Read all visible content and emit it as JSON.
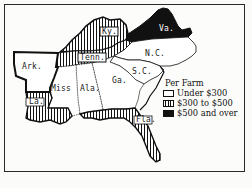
{
  "map": {
    "region": "Southern United States",
    "states": [
      {
        "id": "ark",
        "label": "Ark.",
        "category": "under_300"
      },
      {
        "id": "la",
        "label": "La.",
        "category": "300_to_500"
      },
      {
        "id": "miss",
        "label": "Miss",
        "category": "under_300"
      },
      {
        "id": "ala",
        "label": "Ala.",
        "category": "under_300"
      },
      {
        "id": "tenn",
        "label": "Tenn.",
        "category": "300_to_500"
      },
      {
        "id": "ky",
        "label": "Ky.",
        "category": "300_to_500"
      },
      {
        "id": "ga",
        "label": "Ga.",
        "category": "under_300"
      },
      {
        "id": "sc",
        "label": "S.C.",
        "category": "under_300"
      },
      {
        "id": "nc",
        "label": "N.C.",
        "category": "under_300"
      },
      {
        "id": "va",
        "label": "Va.",
        "category": "500_and_over"
      },
      {
        "id": "fla",
        "label": "Fla.",
        "category": "300_to_500"
      }
    ]
  },
  "legend": {
    "title": "Per Farm",
    "items": [
      {
        "key": "under_300",
        "label": "Under $300",
        "pattern": "white"
      },
      {
        "key": "300_to_500",
        "label": "$300 to $500",
        "pattern": "vertical-hatch"
      },
      {
        "key": "500_and_over",
        "label": "$500 and over",
        "pattern": "solid-black"
      }
    ]
  },
  "colors": {
    "ink": "#111111",
    "paper": "#fcfcfa"
  }
}
